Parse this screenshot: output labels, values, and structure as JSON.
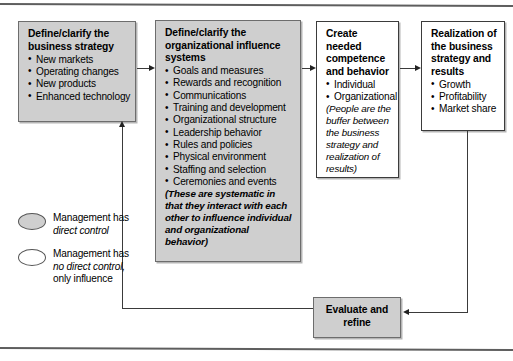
{
  "figure": {
    "title_rule_top": "",
    "title_rule_bottom": ""
  },
  "boxes": {
    "strategy": {
      "heading": "Define/clarify the business strategy",
      "items": [
        "New markets",
        "Operating changes",
        "New products",
        "Enhanced technology"
      ],
      "fill": "#cfcfcf",
      "control": "direct"
    },
    "influence": {
      "heading": "Define/clarify the organizational influence systems",
      "items": [
        "Goals and measures",
        "Rewards and recognition",
        "Communications",
        "Training and development",
        "Organizational structure",
        "Leadership behavior",
        "Rules and policies",
        "Physical environment",
        "Staffing and selection",
        "Ceremonies and events"
      ],
      "note": "(These are systematic in that they interact with each other to influence individual and organizational behavior)",
      "fill": "#cfcfcf",
      "control": "direct"
    },
    "competence": {
      "heading": "Create needed competence and behavior",
      "items": [
        "Individual",
        "Organizational"
      ],
      "note": "(People are the buffer between the business strategy and realization of results)",
      "fill": "#ffffff",
      "control": "no-direct"
    },
    "realization": {
      "heading": "Realization of the business strategy and results",
      "items": [
        "Growth",
        "Profitability",
        "Market share"
      ],
      "fill": "#ffffff",
      "control": "no-direct"
    },
    "evaluate": {
      "heading": "Evaluate and refine",
      "fill": "#cfcfcf",
      "control": "direct"
    }
  },
  "legend": [
    {
      "swatch": "filled",
      "line1": "Management has",
      "line2": "direct control",
      "line3": ""
    },
    {
      "swatch": "hollow",
      "line1": "Management has",
      "line2": "no direct control,",
      "line3": "only influence"
    }
  ],
  "connectors": [
    {
      "name": "strategy-to-influence",
      "direction": "right"
    },
    {
      "name": "influence-to-competence",
      "direction": "right"
    },
    {
      "name": "competence-to-realization",
      "direction": "right"
    },
    {
      "name": "realization-to-evaluate",
      "direction": "left"
    },
    {
      "name": "evaluate-to-strategy-feedback",
      "direction": "up"
    }
  ]
}
